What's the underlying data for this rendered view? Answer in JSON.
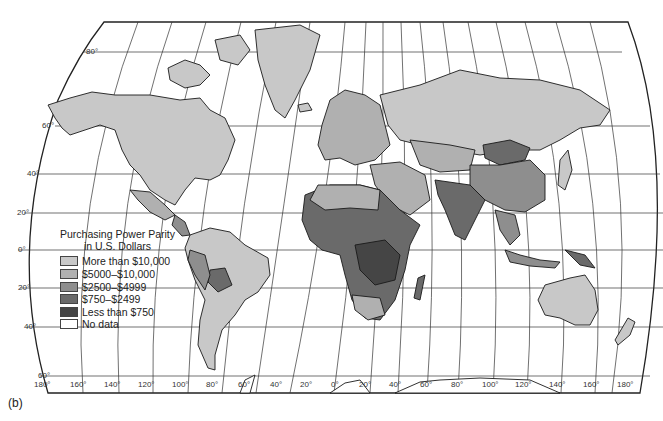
{
  "figure_label": "(b)",
  "legend": {
    "title_line1": "Purchasing Power Parity",
    "title_line2": "in U.S. Dollars",
    "items": [
      {
        "label": "More than $10,000",
        "color": "#c8c8c8"
      },
      {
        "label": "$5000–$10,000",
        "color": "#b0b0b0"
      },
      {
        "label": "$2500–$4999",
        "color": "#8e8e8e"
      },
      {
        "label": "$750–$2499",
        "color": "#6a6a6a"
      },
      {
        "label": "Less than $750",
        "color": "#454545"
      },
      {
        "label": "No data",
        "color": "#ffffff"
      }
    ]
  },
  "latitude_labels": [
    "80°",
    "60°",
    "40°",
    "20°",
    "0°",
    "20°",
    "40°",
    "60°"
  ],
  "longitude_labels": [
    "180°",
    "160°",
    "140°",
    "120°",
    "100°",
    "80°",
    "60°",
    "40°",
    "20°",
    "0°",
    "20°",
    "40°",
    "60°",
    "80°",
    "100°",
    "120°",
    "140°",
    "160°",
    "180°"
  ]
}
